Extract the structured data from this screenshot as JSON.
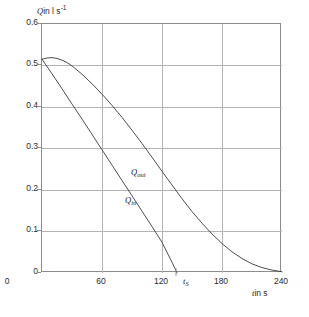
{
  "chart_data": {
    "type": "line",
    "title": "",
    "xlabel": "t in s",
    "ylabel": "Q in l s-1",
    "ylabel_symbol": "Q",
    "ylabel_unit": "in l s",
    "ylabel_exponent": "-1",
    "xlabel_symbol": "t",
    "xlabel_unit": "in s",
    "xlim": [
      0,
      240
    ],
    "ylim": [
      0,
      0.6
    ],
    "grid": true,
    "legend_position": "inline-annotations",
    "xticks": [
      0,
      60,
      120,
      180,
      240
    ],
    "xtick_labels": [
      "0",
      "60",
      "120",
      "180",
      "240"
    ],
    "yticks": [
      0,
      0.1,
      0.2,
      0.3,
      0.4,
      0.5,
      0.6
    ],
    "ytick_labels": [
      "0",
      "0.1",
      "0.2",
      "0.3",
      "0.4",
      "0.5",
      "0.6"
    ],
    "annotations": [
      {
        "name": "t_S",
        "symbol": "t",
        "subscript": "S",
        "x": 135,
        "y": 0
      },
      {
        "name": "Q_out",
        "symbol": "Q",
        "subscript": "out"
      },
      {
        "name": "Q_in",
        "symbol": "Q",
        "subscript": "in"
      }
    ],
    "series": [
      {
        "name": "Q_out",
        "label": "Q",
        "sublabel": "out",
        "color": "#3a3a3a",
        "x": [
          0,
          5,
          10,
          15,
          20,
          25,
          30,
          40,
          50,
          60,
          70,
          80,
          90,
          100,
          110,
          120,
          130,
          140,
          150,
          160,
          170,
          180,
          190,
          200,
          210,
          220,
          230,
          240
        ],
        "y": [
          0.515,
          0.518,
          0.519,
          0.517,
          0.513,
          0.507,
          0.499,
          0.479,
          0.456,
          0.431,
          0.404,
          0.375,
          0.344,
          0.312,
          0.279,
          0.245,
          0.212,
          0.179,
          0.148,
          0.12,
          0.094,
          0.071,
          0.051,
          0.035,
          0.022,
          0.013,
          0.007,
          0.003
        ]
      },
      {
        "name": "Q_in",
        "label": "Q",
        "sublabel": "in",
        "color": "#3a3a3a",
        "x": [
          0,
          10,
          20,
          30,
          40,
          50,
          60,
          70,
          80,
          90,
          100,
          110,
          120,
          130,
          135
        ],
        "y": [
          0.515,
          0.48,
          0.444,
          0.407,
          0.371,
          0.334,
          0.297,
          0.26,
          0.223,
          0.186,
          0.149,
          0.112,
          0.074,
          0.026,
          0.0
        ]
      }
    ]
  },
  "caption": {
    "text": ""
  }
}
